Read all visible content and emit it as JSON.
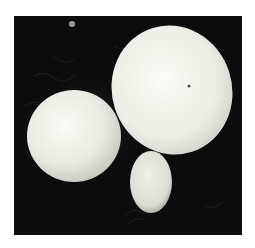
{
  "image": {
    "subject": "scanning electron micrograph of budding yeast cells",
    "background_color": "#0c0c0c",
    "page_color": "#ffffff",
    "objects": [
      {
        "name": "left-cell",
        "shape": "sphere"
      },
      {
        "name": "large-cell",
        "shape": "oval"
      },
      {
        "name": "bud",
        "shape": "small oval attached to bottom of large cell"
      }
    ]
  }
}
